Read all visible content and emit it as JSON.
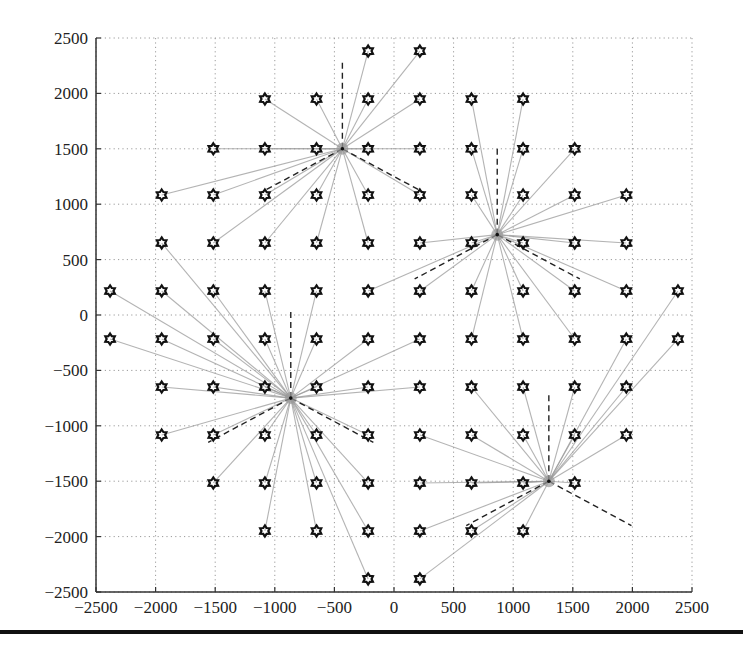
{
  "chart_data": {
    "type": "scatter",
    "title": "",
    "xlabel": "",
    "ylabel": "",
    "xlim": [
      -2500,
      2500
    ],
    "ylim": [
      -2500,
      2500
    ],
    "xticks": [
      -2500,
      -2000,
      -1500,
      -1000,
      -500,
      0,
      500,
      1000,
      1500,
      2000,
      2500
    ],
    "yticks": [
      -2500,
      -2000,
      -1500,
      -1000,
      -500,
      0,
      500,
      1000,
      1500,
      2000,
      2500
    ],
    "xtick_labels": [
      "−2500",
      "−2000",
      "−1500",
      "−1000",
      "−500",
      "0",
      "500",
      "1000",
      "1500",
      "2000",
      "2500"
    ],
    "ytick_labels": [
      "−2500",
      "−2000",
      "−1500",
      "−1000",
      "−500",
      "0",
      "500",
      "1000",
      "1500",
      "2000",
      "2500"
    ],
    "grid": "dotted",
    "legend": null,
    "colors": {
      "point": "#111111",
      "link": "#9a9a9a",
      "dash": "#222222",
      "grid": "#9a9a9a",
      "axis": "#333333"
    },
    "base_stations": [
      {
        "name": "BS1",
        "x": -433,
        "y": 1500,
        "sector_dirs_deg": [
          90,
          210,
          330
        ]
      },
      {
        "name": "BS2",
        "x": 866,
        "y": 725,
        "sector_dirs_deg": [
          90,
          210,
          330
        ]
      },
      {
        "name": "BS3",
        "x": -866,
        "y": -750,
        "sector_dirs_deg": [
          90,
          210,
          330
        ]
      },
      {
        "name": "BS4",
        "x": 1299,
        "y": -1500,
        "sector_dirs_deg": [
          90,
          210,
          330
        ]
      }
    ],
    "sector_line_length": 800,
    "users": [
      {
        "x": -217,
        "y": 2382,
        "bs": 0
      },
      {
        "x": 217,
        "y": 2382,
        "bs": 0
      },
      {
        "x": -1083,
        "y": 1949,
        "bs": 0
      },
      {
        "x": -650,
        "y": 1949,
        "bs": 0
      },
      {
        "x": -217,
        "y": 1949,
        "bs": 0
      },
      {
        "x": 217,
        "y": 1949,
        "bs": 0
      },
      {
        "x": 650,
        "y": 1949,
        "bs": 1
      },
      {
        "x": 1083,
        "y": 1949,
        "bs": 1
      },
      {
        "x": -1516,
        "y": 1500,
        "bs": 0
      },
      {
        "x": -1083,
        "y": 1500,
        "bs": 0
      },
      {
        "x": -650,
        "y": 1500,
        "bs": 0
      },
      {
        "x": -217,
        "y": 1500,
        "bs": 0
      },
      {
        "x": 217,
        "y": 1500,
        "bs": 0
      },
      {
        "x": 650,
        "y": 1500,
        "bs": 1
      },
      {
        "x": 1083,
        "y": 1500,
        "bs": 1
      },
      {
        "x": 1516,
        "y": 1500,
        "bs": 1
      },
      {
        "x": -1949,
        "y": 1083,
        "bs": 0
      },
      {
        "x": -1516,
        "y": 1083,
        "bs": 0
      },
      {
        "x": -1083,
        "y": 1083,
        "bs": 0
      },
      {
        "x": -650,
        "y": 1083,
        "bs": 0
      },
      {
        "x": -217,
        "y": 1083,
        "bs": 0
      },
      {
        "x": 217,
        "y": 1083,
        "bs": 0
      },
      {
        "x": 650,
        "y": 1083,
        "bs": 1
      },
      {
        "x": 1083,
        "y": 1083,
        "bs": 1
      },
      {
        "x": 1516,
        "y": 1083,
        "bs": 1
      },
      {
        "x": 1949,
        "y": 1083,
        "bs": 1
      },
      {
        "x": -1949,
        "y": 650,
        "bs": 2
      },
      {
        "x": -1516,
        "y": 650,
        "bs": 0
      },
      {
        "x": -1083,
        "y": 650,
        "bs": 0
      },
      {
        "x": -650,
        "y": 650,
        "bs": 0
      },
      {
        "x": -217,
        "y": 650,
        "bs": 0
      },
      {
        "x": 217,
        "y": 650,
        "bs": 1
      },
      {
        "x": 650,
        "y": 650,
        "bs": 1
      },
      {
        "x": 1083,
        "y": 650,
        "bs": 1
      },
      {
        "x": 1516,
        "y": 650,
        "bs": 1
      },
      {
        "x": 1949,
        "y": 650,
        "bs": 1
      },
      {
        "x": -2382,
        "y": 217,
        "bs": 2
      },
      {
        "x": -1949,
        "y": 217,
        "bs": 2
      },
      {
        "x": -1516,
        "y": 217,
        "bs": 2
      },
      {
        "x": -1083,
        "y": 217,
        "bs": 2
      },
      {
        "x": -650,
        "y": 217,
        "bs": 2
      },
      {
        "x": -217,
        "y": 217,
        "bs": 1
      },
      {
        "x": 217,
        "y": 217,
        "bs": 1
      },
      {
        "x": 650,
        "y": 217,
        "bs": 1
      },
      {
        "x": 1083,
        "y": 217,
        "bs": 1
      },
      {
        "x": 1516,
        "y": 217,
        "bs": 1
      },
      {
        "x": 1949,
        "y": 217,
        "bs": 1
      },
      {
        "x": 2382,
        "y": 217,
        "bs": 3
      },
      {
        "x": -2382,
        "y": -217,
        "bs": 2
      },
      {
        "x": -1949,
        "y": -217,
        "bs": 2
      },
      {
        "x": -1516,
        "y": -217,
        "bs": 2
      },
      {
        "x": -1083,
        "y": -217,
        "bs": 2
      },
      {
        "x": -650,
        "y": -217,
        "bs": 2
      },
      {
        "x": -217,
        "y": -217,
        "bs": 2
      },
      {
        "x": 217,
        "y": -217,
        "bs": 2
      },
      {
        "x": 650,
        "y": -217,
        "bs": 1
      },
      {
        "x": 1083,
        "y": -217,
        "bs": 1
      },
      {
        "x": 1516,
        "y": -217,
        "bs": 1
      },
      {
        "x": 1949,
        "y": -217,
        "bs": 3
      },
      {
        "x": 2382,
        "y": -217,
        "bs": 3
      },
      {
        "x": -1949,
        "y": -650,
        "bs": 2
      },
      {
        "x": -1516,
        "y": -650,
        "bs": 2
      },
      {
        "x": -1083,
        "y": -650,
        "bs": 2
      },
      {
        "x": -650,
        "y": -650,
        "bs": 2
      },
      {
        "x": -217,
        "y": -650,
        "bs": 2
      },
      {
        "x": 217,
        "y": -650,
        "bs": 2
      },
      {
        "x": 650,
        "y": -650,
        "bs": 3
      },
      {
        "x": 1083,
        "y": -650,
        "bs": 3
      },
      {
        "x": 1516,
        "y": -650,
        "bs": 3
      },
      {
        "x": 1949,
        "y": -650,
        "bs": 3
      },
      {
        "x": -1949,
        "y": -1083,
        "bs": 2
      },
      {
        "x": -1516,
        "y": -1083,
        "bs": 2
      },
      {
        "x": -1083,
        "y": -1083,
        "bs": 2
      },
      {
        "x": -650,
        "y": -1083,
        "bs": 2
      },
      {
        "x": -217,
        "y": -1083,
        "bs": 2
      },
      {
        "x": 217,
        "y": -1083,
        "bs": 3
      },
      {
        "x": 650,
        "y": -1083,
        "bs": 3
      },
      {
        "x": 1083,
        "y": -1083,
        "bs": 3
      },
      {
        "x": 1516,
        "y": -1083,
        "bs": 3
      },
      {
        "x": 1949,
        "y": -1083,
        "bs": 3
      },
      {
        "x": -1516,
        "y": -1516,
        "bs": 2
      },
      {
        "x": -1083,
        "y": -1516,
        "bs": 2
      },
      {
        "x": -650,
        "y": -1516,
        "bs": 2
      },
      {
        "x": -217,
        "y": -1516,
        "bs": 2
      },
      {
        "x": 217,
        "y": -1516,
        "bs": 3
      },
      {
        "x": 650,
        "y": -1516,
        "bs": 3
      },
      {
        "x": 1083,
        "y": -1516,
        "bs": 3
      },
      {
        "x": 1516,
        "y": -1516,
        "bs": 3
      },
      {
        "x": -1083,
        "y": -1949,
        "bs": 2
      },
      {
        "x": -650,
        "y": -1949,
        "bs": 2
      },
      {
        "x": -217,
        "y": -1949,
        "bs": 2
      },
      {
        "x": 217,
        "y": -1949,
        "bs": 3
      },
      {
        "x": 650,
        "y": -1949,
        "bs": 3
      },
      {
        "x": 1083,
        "y": -1949,
        "bs": 3
      },
      {
        "x": -217,
        "y": -2382,
        "bs": 2
      },
      {
        "x": 217,
        "y": -2382,
        "bs": 3
      }
    ]
  },
  "plot": {
    "left_px": 96,
    "top_px": 38,
    "right_px": 692,
    "bottom_px": 592
  }
}
